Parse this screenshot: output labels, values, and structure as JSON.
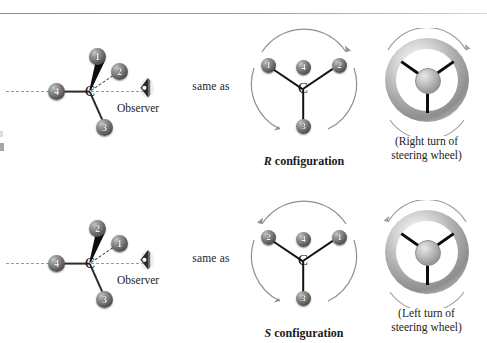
{
  "figure": {
    "rows": [
      {
        "id": "r-row",
        "same_as_label": "same as",
        "tetrahedral": {
          "center_atom": "C",
          "observer_label": "Observer",
          "observer_icon": "eye-icon",
          "substituents": [
            {
              "rank": "1",
              "position": "up-right",
              "bond": "wedge"
            },
            {
              "rank": "2",
              "position": "right-upper",
              "bond": "hash"
            },
            {
              "rank": "3",
              "position": "down-right",
              "bond": "plain"
            },
            {
              "rank": "4",
              "position": "left",
              "bond": "plain"
            }
          ]
        },
        "flat": {
          "center_atom": "C",
          "caption_letter": "R",
          "caption_text": " configuration",
          "rotation": "clockwise",
          "substituents": [
            {
              "rank": "1",
              "position": "upper-left"
            },
            {
              "rank": "4",
              "position": "center-top"
            },
            {
              "rank": "2",
              "position": "upper-right"
            },
            {
              "rank": "3",
              "position": "bottom"
            }
          ]
        },
        "wheel": {
          "icon": "steering-wheel-icon",
          "rotation": "clockwise",
          "caption_line1": "(Right turn of",
          "caption_line2": "steering wheel)"
        }
      },
      {
        "id": "s-row",
        "same_as_label": "same as",
        "tetrahedral": {
          "center_atom": "C",
          "observer_label": "Observer",
          "observer_icon": "eye-icon",
          "substituents": [
            {
              "rank": "2",
              "position": "up-right",
              "bond": "wedge"
            },
            {
              "rank": "1",
              "position": "right-upper",
              "bond": "hash"
            },
            {
              "rank": "3",
              "position": "down-right",
              "bond": "plain"
            },
            {
              "rank": "4",
              "position": "left",
              "bond": "plain"
            }
          ]
        },
        "flat": {
          "center_atom": "C",
          "caption_letter": "S",
          "caption_text": " configuration",
          "rotation": "counterclockwise",
          "substituents": [
            {
              "rank": "2",
              "position": "upper-left"
            },
            {
              "rank": "4",
              "position": "center-top"
            },
            {
              "rank": "1",
              "position": "upper-right"
            },
            {
              "rank": "3",
              "position": "bottom"
            }
          ]
        },
        "wheel": {
          "icon": "steering-wheel-icon",
          "rotation": "counterclockwise",
          "caption_line1": "(Left turn of",
          "caption_line2": "steering wheel)"
        }
      }
    ]
  },
  "colors": {
    "background": "#ffffff",
    "text": "#1a1a1a",
    "bond": "#2b2b2b",
    "wedge": "#0d0d0d",
    "hash": "#4a4a4a",
    "sphere_dark": "#3a3a3a",
    "sphere_light": "#c9c9c9",
    "rule": "#9a9a9a",
    "wheel_rim": "#a8a8a8",
    "wheel_spoke": "#0c0c0c",
    "wheel_hub": "#9a9a9a"
  }
}
